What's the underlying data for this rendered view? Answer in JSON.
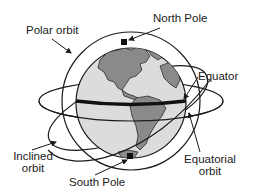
{
  "diagram": {
    "labels": {
      "polar_orbit": "Polar orbit",
      "north_pole": "North Pole",
      "equator": "Equator",
      "inclined_orbit_line1": "Inclined",
      "inclined_orbit_line2": "orbit",
      "south_pole": "South Pole",
      "equatorial_orbit_line1": "Equatorial",
      "equatorial_orbit_line2": "orbit"
    },
    "colors": {
      "ocean": "#dcdcdc",
      "land": "#8a8a8a",
      "outline": "#1a1a1a",
      "equator_band": "#111111",
      "background": "#ffffff"
    },
    "elements": [
      {
        "name": "globe",
        "type": "sphere",
        "note": "Earth showing the Americas"
      },
      {
        "name": "equator-line",
        "type": "band"
      },
      {
        "name": "polar-orbit",
        "type": "orbit"
      },
      {
        "name": "equatorial-orbit",
        "type": "orbit"
      },
      {
        "name": "inclined-orbit",
        "type": "orbit"
      },
      {
        "name": "north-pole-marker",
        "type": "marker"
      },
      {
        "name": "south-pole-marker",
        "type": "marker"
      }
    ]
  }
}
